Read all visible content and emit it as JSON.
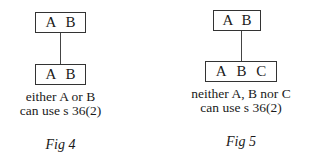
{
  "figures": [
    {
      "top_box": [
        "A",
        "B"
      ],
      "bottom_box": [
        "A",
        "B"
      ],
      "caption_line1": "either A or B",
      "caption_line2": "can use s 36(2)",
      "label": "Fig 4"
    },
    {
      "top_box": [
        "A",
        "B"
      ],
      "bottom_box": [
        "A",
        "B",
        "C"
      ],
      "caption_line1": "neither A, B nor C",
      "caption_line2": "can use s 36(2)",
      "label": "Fig 5"
    }
  ]
}
